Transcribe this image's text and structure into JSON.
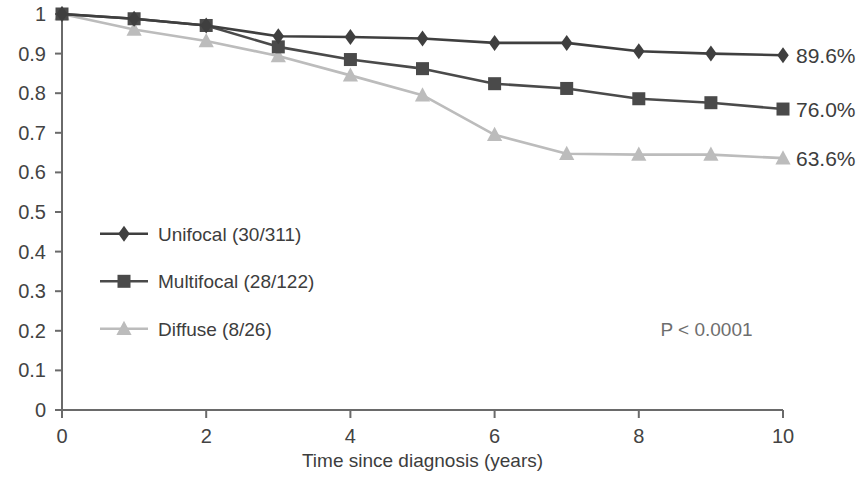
{
  "chart_data": {
    "type": "line",
    "title": "",
    "subtitle": "",
    "xlabel": "Time since diagnosis (years)",
    "ylabel": "",
    "xlim": [
      0,
      10
    ],
    "ylim": [
      0,
      1
    ],
    "grid": false,
    "legend_position": "inside-lower-left",
    "x": [
      0,
      1,
      2,
      3,
      4,
      5,
      6,
      7,
      8,
      9,
      10
    ],
    "xticks": [
      "0",
      "2",
      "4",
      "6",
      "8",
      "10"
    ],
    "xtick_values": [
      0,
      2,
      4,
      6,
      8,
      10
    ],
    "yticks": [
      "0",
      "0.1",
      "0.2",
      "0.3",
      "0.4",
      "0.5",
      "0.6",
      "0.7",
      "0.8",
      "0.9",
      "1"
    ],
    "ytick_values": [
      0,
      0.1,
      0.2,
      0.3,
      0.4,
      0.5,
      0.6,
      0.7,
      0.8,
      0.9,
      1
    ],
    "series": [
      {
        "name": "Unifocal (30/311)",
        "marker": "diamond",
        "color": "#3f3f3f",
        "values": [
          1.0,
          0.988,
          0.971,
          0.944,
          0.942,
          0.938,
          0.927,
          0.927,
          0.906,
          0.9,
          0.896
        ],
        "end_label": "89.6%"
      },
      {
        "name": "Multifocal (28/122)",
        "marker": "square",
        "color": "#4a4a4a",
        "values": [
          1.0,
          0.988,
          0.971,
          0.917,
          0.885,
          0.862,
          0.824,
          0.812,
          0.786,
          0.776,
          0.76
        ],
        "end_label": "76.0%"
      },
      {
        "name": "Diffuse (8/26)",
        "marker": "triangle",
        "color": "#bcbcbc",
        "values": [
          1.0,
          0.961,
          0.932,
          0.894,
          0.845,
          0.795,
          0.695,
          0.647,
          0.645,
          0.645,
          0.636
        ],
        "end_label": "63.6%"
      }
    ],
    "annotations": [
      {
        "text": "P < 0.0001",
        "x": 8.3,
        "y": 0.205
      }
    ]
  },
  "axis": {
    "x_title": "Time since diagnosis (years)"
  },
  "legend": {
    "items": [
      {
        "label": "Unifocal (30/311)"
      },
      {
        "label": "Multifocal (28/122)"
      },
      {
        "label": "Diffuse (8/26)"
      }
    ]
  },
  "end_labels": [
    {
      "text": "89.6%"
    },
    {
      "text": "76.0%"
    },
    {
      "text": "63.6%"
    }
  ],
  "stats": {
    "p_value": "P < 0.0001"
  },
  "colors": {
    "unifocal": "#3f3f3f",
    "multifocal": "#4a4a4a",
    "diffuse": "#bcbcbc",
    "axis": "#6a6a6a",
    "text": "#3d3d3d"
  }
}
